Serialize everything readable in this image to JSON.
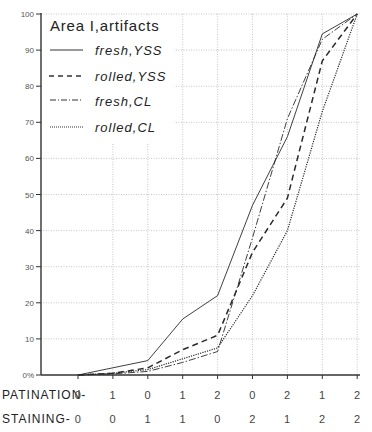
{
  "chart_data": {
    "type": "line",
    "title": "Area I,artifacts",
    "xlabel": "",
    "ylabel": "",
    "ylim": [
      0,
      100
    ],
    "yticks": [
      "0%",
      "10",
      "20",
      "30",
      "40",
      "50",
      "60",
      "70",
      "80",
      "90",
      "100"
    ],
    "grid": true,
    "legend_position": "upper left",
    "x_rows": [
      {
        "label": "PATINATION-",
        "values": [
          "0",
          "1",
          "0",
          "1",
          "2",
          "0",
          "2",
          "1",
          "2"
        ]
      },
      {
        "label": "STAINING-",
        "values": [
          "0",
          "0",
          "1",
          "1",
          "0",
          "2",
          "1",
          "2",
          "2"
        ]
      }
    ],
    "categories": [
      "P0/S0",
      "P1/S0",
      "P0/S1",
      "P1/S1",
      "P2/S0",
      "P0/S2",
      "P2/S1",
      "P1/S2",
      "P2/S2"
    ],
    "series": [
      {
        "name": "fresh,YSS",
        "style": "solid",
        "values": [
          0,
          2,
          4,
          15.5,
          22,
          47,
          66,
          94.5,
          100
        ]
      },
      {
        "name": "rolled,YSS",
        "style": "dashed",
        "values": [
          0,
          0.5,
          2,
          7,
          11,
          34,
          49,
          87,
          100
        ]
      },
      {
        "name": "fresh,CL",
        "style": "dash-dot",
        "values": [
          0,
          0.3,
          1,
          3.5,
          6.5,
          38,
          71,
          93,
          100
        ]
      },
      {
        "name": "rolled,CL",
        "style": "dotted",
        "values": [
          0,
          0.5,
          1.5,
          4.5,
          7.5,
          22,
          40,
          73,
          100
        ]
      }
    ]
  },
  "legend": {
    "title": "Area I,artifacts",
    "items": [
      {
        "label": "fresh,YSS"
      },
      {
        "label": "rolled,YSS"
      },
      {
        "label": "fresh,CL"
      },
      {
        "label": "rolled,CL"
      }
    ]
  }
}
